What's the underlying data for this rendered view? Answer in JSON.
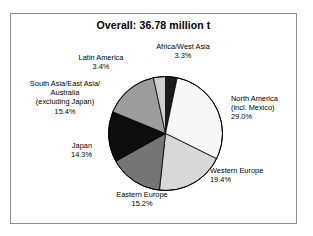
{
  "figure": {
    "title": "Overall: 36.78 million t",
    "frame_color": "#8d8d8d",
    "background": "#ffffff"
  },
  "chart_data": {
    "type": "pie",
    "title": "Overall: 36.78 million t",
    "total_label": "36.78 million t",
    "total_value": 36.78,
    "unit": "million t",
    "start_angle_deg": 0,
    "direction": "clockwise",
    "legend": "none",
    "labels_outside": true,
    "categories": [
      "Africa/West Asia",
      "North America (incl. Mexico)",
      "Western Europe",
      "Eastern Europe",
      "Japan",
      "South Asia/East Asia/Australia (excluding Japan)",
      "Latin America"
    ],
    "values": [
      3.3,
      29.0,
      19.4,
      15.2,
      14.3,
      15.4,
      3.4
    ],
    "value_unit": "%",
    "colors": [
      "#1a1a1a",
      "#f7f7f7",
      "#d8d8d8",
      "#757575",
      "#0d0d0d",
      "#9d9d9d",
      "#cfcfcf"
    ],
    "slices": [
      {
        "name": "africa-west-asia",
        "label_lines": [
          "Africa/West Asia"
        ],
        "percent_label": "3.3%",
        "value": 3.3,
        "color": "#1a1a1a"
      },
      {
        "name": "north-america",
        "label_lines": [
          "North America",
          "(incl. Mexico)"
        ],
        "percent_label": "29.0%",
        "value": 29.0,
        "color": "#f7f7f7"
      },
      {
        "name": "western-europe",
        "label_lines": [
          "Western Europe"
        ],
        "percent_label": "19.4%",
        "value": 19.4,
        "color": "#d8d8d8"
      },
      {
        "name": "eastern-europe",
        "label_lines": [
          "Eastern Europe"
        ],
        "percent_label": "15.2%",
        "value": 15.2,
        "color": "#757575"
      },
      {
        "name": "japan",
        "label_lines": [
          "Japan"
        ],
        "percent_label": "14.3%",
        "value": 14.3,
        "color": "#0d0d0d"
      },
      {
        "name": "south-asia-east-asia-australia",
        "label_lines": [
          "South Asia/East Asia/",
          "Australia",
          "(excluding Japan)"
        ],
        "percent_label": "15.4%",
        "value": 15.4,
        "color": "#9d9d9d"
      },
      {
        "name": "latin-america",
        "label_lines": [
          "Latin America"
        ],
        "percent_label": "3.4%",
        "value": 3.4,
        "color": "#cfcfcf"
      }
    ]
  },
  "labels": {
    "africa": {
      "line1": "Africa/West Asia",
      "pct": "3.3%"
    },
    "north_america": {
      "line1": "North America",
      "line2": "(incl. Mexico)",
      "pct": "29.0%"
    },
    "western_europe": {
      "line1": "Western Europe",
      "pct": "19.4%"
    },
    "eastern_europe": {
      "line1": "Eastern Europe",
      "pct": "15.2%"
    },
    "japan": {
      "line1": "Japan",
      "pct": "14.3%"
    },
    "south_asia": {
      "line1": "South Asia/East Asia/",
      "line2": "Australia",
      "line3": "(excluding Japan)",
      "pct": "15.4%"
    },
    "latin_america": {
      "line1": "Latin America",
      "pct": "3.4%"
    }
  }
}
